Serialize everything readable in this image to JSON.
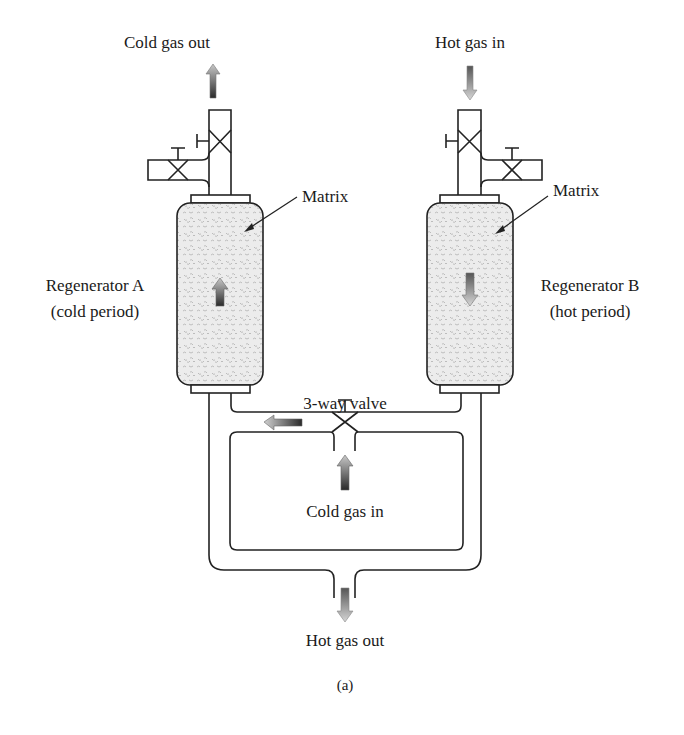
{
  "figure": {
    "caption": "(a)",
    "labels": {
      "cold_gas_out": "Cold gas out",
      "hot_gas_in": "Hot gas in",
      "matrix_a": "Matrix",
      "matrix_b": "Matrix",
      "regenerator_a_name": "Regenerator A",
      "regenerator_a_period": "(cold period)",
      "regenerator_b_name": "Regenerator B",
      "regenerator_b_period": "(hot period)",
      "three_way_valve": "3-way valve",
      "cold_gas_in": "Cold gas in",
      "hot_gas_out": "Hot gas out"
    },
    "components": [
      {
        "id": "regenerator-a",
        "name": "Regenerator A",
        "state": "cold period",
        "flow": "up"
      },
      {
        "id": "regenerator-b",
        "name": "Regenerator B",
        "state": "hot period",
        "flow": "down"
      },
      {
        "id": "three-way-valve",
        "name": "3-way valve"
      },
      {
        "id": "valve-a-top",
        "type": "gate valve"
      },
      {
        "id": "valve-a-side",
        "type": "gate valve"
      },
      {
        "id": "valve-b-top",
        "type": "gate valve"
      },
      {
        "id": "valve-b-side",
        "type": "gate valve"
      }
    ],
    "colors": {
      "cold_arrow_dark": "#333333",
      "hot_arrow_light": "#bbbbbb",
      "matrix_fill": "#e6e6e6",
      "line": "#222222"
    }
  }
}
